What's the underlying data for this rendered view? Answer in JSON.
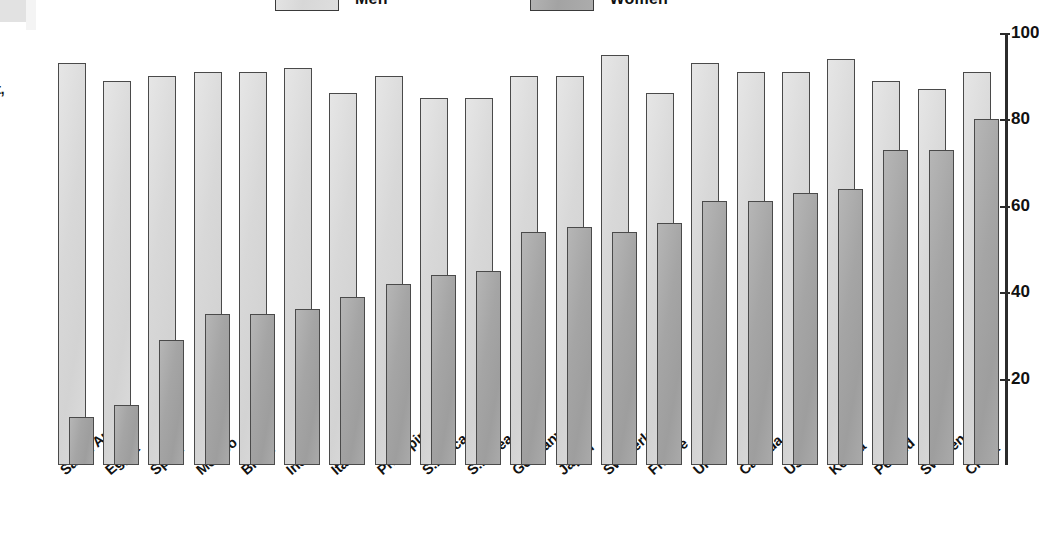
{
  "legend": {
    "items": [
      {
        "label": "Men",
        "swatch": "men-swatch",
        "color": "#d8d8d8"
      },
      {
        "label": "Women",
        "swatch": "women-swatch",
        "color": "#a5a5a5"
      }
    ]
  },
  "axis_title_fragment": "t,",
  "y_axis": {
    "ticks": [
      "100",
      "80",
      "60",
      "40",
      "20"
    ],
    "tick_values": [
      100,
      80,
      60,
      40,
      20
    ]
  },
  "chart_data": {
    "type": "bar",
    "title": "",
    "xlabel": "",
    "ylabel": "",
    "ylim": [
      0,
      100
    ],
    "grid": false,
    "legend_position": "top-center",
    "categories": [
      "Saudi Arabia",
      "Egypt",
      "Spain",
      "Mexico",
      "Brazil",
      "India",
      "Italy",
      "Philippines",
      "S.Africa",
      "S.Korea",
      "Germany",
      "Japan",
      "Switzerland",
      "France",
      "UK",
      "Canada",
      "USA",
      "Kenya",
      "Poland",
      "Sweden",
      "China"
    ],
    "series": [
      {
        "name": "Men",
        "color": "#d8d8d8",
        "values": [
          93,
          89,
          90,
          91,
          91,
          92,
          86,
          90,
          85,
          85,
          90,
          90,
          95,
          86,
          93,
          91,
          91,
          94,
          89,
          87,
          91
        ]
      },
      {
        "name": "Women",
        "color": "#a5a5a5",
        "values": [
          11,
          14,
          29,
          35,
          35,
          36,
          39,
          42,
          44,
          45,
          54,
          55,
          54,
          56,
          61,
          61,
          63,
          64,
          73,
          73,
          80
        ]
      }
    ]
  }
}
